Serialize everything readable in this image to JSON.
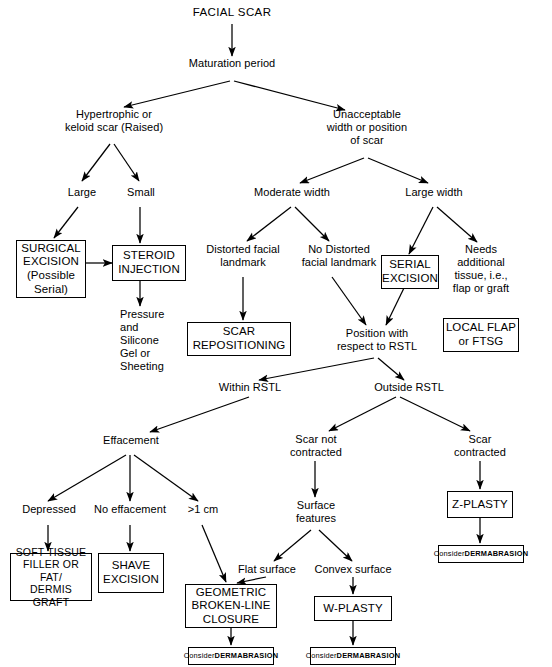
{
  "diagram": {
    "type": "flowchart",
    "stroke_color": "#000000",
    "background_color": "#ffffff"
  },
  "nodes": {
    "facial_scar": "FACIAL SCAR",
    "maturation_period": "Maturation period",
    "hypertrophic": "Hypertrophic or\nkeloid scar (Raised)",
    "unacceptable": "Unacceptable\nwidth or position\nof scar",
    "large": "Large",
    "small": "Small",
    "moderate_width": "Moderate width",
    "large_width": "Large width",
    "surgical_excision": "SURGICAL\nEXCISION\n(Possible\nSerial)",
    "steroid_injection": "STEROID\nINJECTION",
    "pressure_silicone": "Pressure\nand\nSilicone\nGel or\nSheeting",
    "distorted_landmark": "Distorted facial\nlandmark",
    "no_distorted_landmark": "No Distorted\nfacial landmark",
    "scar_repositioning": "SCAR\nREPOSITIONING",
    "serial_excision": "SERIAL\nEXCISION",
    "needs_tissue": "Needs\nadditional\ntissue, i.e.,\nflap or graft",
    "local_flap": "LOCAL FLAP\nor FTSG",
    "position_rstl": "Position with\nrespect to RSTL",
    "within_rstl": "Within RSTL",
    "outside_rstl": "Outside RSTL",
    "effacement": "Effacement",
    "scar_not_contracted": "Scar not\ncontracted",
    "scar_contracted": "Scar\ncontracted",
    "depressed": "Depressed",
    "no_effacement": "No effacement",
    "greater_1cm": ">1 cm",
    "surface_features": "Surface\nfeatures",
    "z_plasty": "Z-PLASTY",
    "soft_tissue_filler": "SOFT TISSUE\nFILLER OR FAT/\nDERMIS GRAFT",
    "shave_excision": "SHAVE\nEXCISION",
    "flat_surface": "Flat surface",
    "convex_surface": "Convex surface",
    "geometric_closure": "GEOMETRIC\nBROKEN-LINE\nCLOSURE",
    "w_plasty": "W-PLASTY",
    "consider_prefix": "Consider ",
    "dermabrasion": "DERMABRASION"
  }
}
